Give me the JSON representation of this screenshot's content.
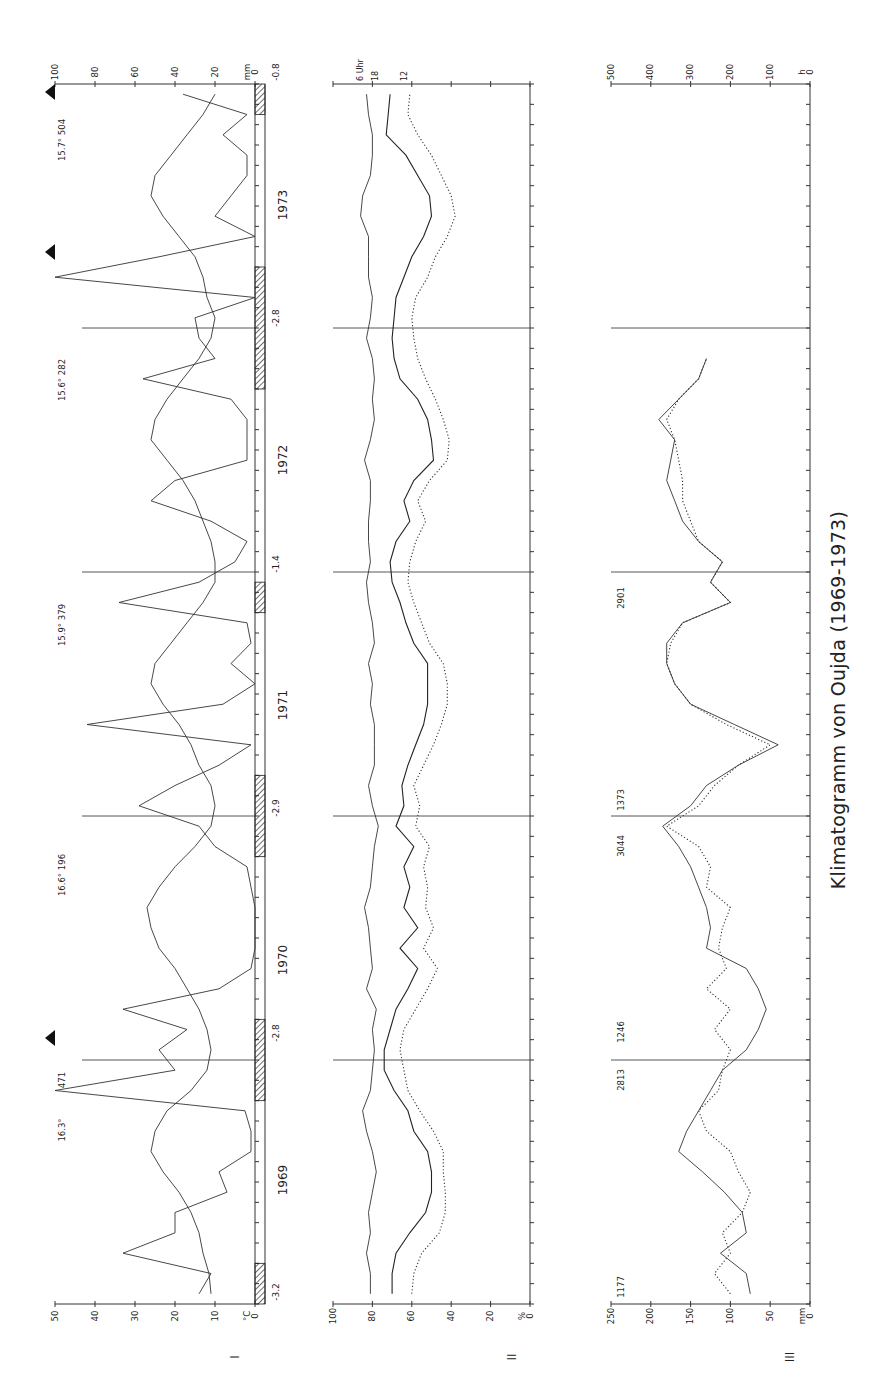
{
  "figure": {
    "title": "Klimatogramm von Oujda (1969-1973)",
    "orientation": "rotated 90° counter-clockwise; time axis runs bottom (Jan 1969) to top (Dec 1973)"
  },
  "panels": [
    {
      "id": "I",
      "label": "I"
    },
    {
      "id": "II",
      "label": "II"
    },
    {
      "id": "III",
      "label": "III"
    }
  ],
  "chart_data": [
    {
      "type": "line",
      "panel": "I",
      "title": "Temperatur und Niederschlag",
      "x_label": "Monat (1969-1973)",
      "years": [
        "1969",
        "1970",
        "1971",
        "1972",
        "1973"
      ],
      "months_per_year": 12,
      "y_left": {
        "unit": "°C",
        "ticks": [
          "0",
          "10",
          "20",
          "30",
          "40",
          "50"
        ],
        "range": [
          0,
          50
        ]
      },
      "y_right": {
        "unit": "mm",
        "ticks": [
          "0",
          "20",
          "40",
          "60",
          "80",
          "100"
        ],
        "range": [
          0,
          100
        ]
      },
      "series": [
        {
          "name": "Monatsmitteltemperatur (°C)",
          "style": "solid",
          "values": [
            11,
            11.5,
            13,
            14,
            16,
            19,
            23,
            26,
            25,
            22,
            16,
            12,
            11,
            12,
            14,
            17,
            20,
            24,
            26,
            27,
            24,
            20,
            15,
            11,
            10,
            11,
            14,
            16,
            19,
            23,
            26,
            25,
            21,
            17,
            13,
            10,
            10,
            11,
            13,
            15,
            18,
            22,
            26,
            25,
            22,
            18,
            14,
            11,
            10,
            12,
            13,
            15,
            19,
            23,
            26,
            25,
            21,
            17,
            13,
            10
          ]
        },
        {
          "name": "Niederschlag (mm)",
          "style": "solid-peaked",
          "values": [
            28,
            22,
            66,
            40,
            40,
            14,
            18,
            2,
            2,
            5,
            100,
            40,
            48,
            34,
            66,
            18,
            2,
            0,
            0,
            0,
            2,
            4,
            20,
            28,
            58,
            40,
            18,
            2,
            84,
            16,
            0,
            12,
            2,
            4,
            68,
            28,
            10,
            4,
            22,
            52,
            40,
            4,
            4,
            4,
            12,
            56,
            20,
            28,
            30,
            0,
            100,
            48,
            0,
            20,
            12,
            4,
            4,
            16,
            4,
            36
          ]
        }
      ],
      "cold_bars": {
        "description": "hatched bars = absolute minimum below 0 °C",
        "labels": [
          "-3.2",
          "-2.8",
          "-2.9",
          "-1.4",
          "-2.8",
          "-0.8"
        ]
      },
      "annotations": [
        {
          "text": "16.3°",
          "year": "1969"
        },
        {
          "text": "471",
          "year": "1969"
        },
        {
          "text": "16.6° 196",
          "year": "1970"
        },
        {
          "text": "15.9° 379",
          "year": "1971"
        },
        {
          "text": "15.6° 282",
          "year": "1972"
        },
        {
          "text": "15.7° 504",
          "year": "1973"
        }
      ],
      "overflow_markers": [
        "1969 Nov",
        "1973 Feb",
        "1973 Dec"
      ]
    },
    {
      "type": "line",
      "panel": "II",
      "title": "Relative Luftfeuchtigkeit",
      "y": {
        "unit": "%",
        "ticks": [
          "0",
          "20",
          "40",
          "60",
          "80",
          "100"
        ],
        "range": [
          0,
          100
        ]
      },
      "legend": [
        "6 Uhr",
        "18",
        "12"
      ],
      "series": [
        {
          "name": "6 Uhr",
          "style": "solid",
          "values": [
            81,
            81,
            83,
            81,
            82,
            80,
            78,
            80,
            83,
            85,
            81,
            80,
            79,
            80,
            78,
            83,
            80,
            81,
            82,
            84,
            81,
            80,
            79,
            77,
            80,
            82,
            79,
            79,
            79,
            81,
            80,
            82,
            79,
            80,
            82,
            83,
            81,
            82,
            82,
            81,
            81,
            84,
            81,
            79,
            80,
            79,
            80,
            83,
            81,
            80,
            82,
            82,
            82,
            86,
            85,
            81,
            80,
            80,
            82,
            83
          ]
        },
        {
          "name": "18 Uhr",
          "style": "solid",
          "values": [
            70,
            70,
            68,
            61,
            53,
            50,
            50,
            52,
            59,
            62,
            69,
            74,
            74,
            71,
            68,
            62,
            57,
            66,
            57,
            64,
            61,
            64,
            59,
            68,
            64,
            65,
            62,
            58,
            54,
            52,
            52,
            52,
            59,
            63,
            66,
            70,
            71,
            68,
            61,
            64,
            59,
            49,
            50,
            52,
            57,
            66,
            69,
            70,
            69,
            68,
            64,
            60,
            54,
            50,
            51,
            57,
            63,
            73,
            72,
            71
          ]
        },
        {
          "name": "12 Uhr",
          "style": "dotted",
          "values": [
            60,
            59,
            55,
            46,
            43,
            43,
            44,
            44,
            49,
            56,
            62,
            64,
            66,
            64,
            58,
            52,
            47,
            54,
            49,
            53,
            52,
            54,
            51,
            58,
            56,
            59,
            54,
            49,
            45,
            42,
            42,
            44,
            51,
            55,
            59,
            62,
            61,
            58,
            53,
            57,
            51,
            42,
            41,
            44,
            48,
            53,
            57,
            59,
            60,
            58,
            52,
            48,
            42,
            38,
            40,
            45,
            50,
            57,
            62,
            61
          ]
        }
      ]
    },
    {
      "type": "line",
      "panel": "III",
      "title": "Niederschlag und Sonnenscheindauer",
      "y_left": {
        "unit": "mm",
        "ticks": [
          "0",
          "50",
          "100",
          "150",
          "200",
          "250"
        ],
        "range": [
          0,
          250
        ]
      },
      "y_right": {
        "unit": "h",
        "ticks": [
          "0",
          "100",
          "200",
          "300",
          "400",
          "500"
        ],
        "range": [
          0,
          500
        ]
      },
      "series": [
        {
          "name": "Sonnenscheindauer (h)",
          "style": "solid",
          "values": [
            150,
            160,
            225,
            160,
            170,
            215,
            270,
            330,
            310,
            280,
            250,
            220,
            160,
            130,
            110,
            130,
            160,
            260,
            250,
            260,
            280,
            300,
            330,
            370,
            300,
            260,
            180,
            80,
            190,
            300,
            340,
            360,
            360,
            320,
            200,
            250,
            220,
            280,
            320,
            340,
            360,
            350,
            340,
            380,
            330,
            280,
            260,
            220,
            160,
            130,
            240,
            90,
            200,
            220,
            260,
            320,
            300,
            340,
            280,
            360
          ]
        },
        {
          "name": "Niederschlag (mm)",
          "style": "dotted",
          "values": [
            200,
            240,
            200,
            220,
            170,
            150,
            180,
            200,
            260,
            280,
            230,
            220,
            200,
            240,
            200,
            260,
            210,
            230,
            220,
            200,
            260,
            250,
            280,
            360,
            280,
            240,
            180,
            100,
            210,
            300,
            340,
            360,
            350,
            320,
            200,
            250,
            220,
            280,
            300,
            320,
            320,
            330,
            340,
            360,
            330,
            280,
            260,
            220,
            160,
            130,
            240,
            90,
            200,
            220,
            260,
            320,
            300,
            340,
            280,
            360
          ]
        }
      ],
      "annotations": [
        {
          "text": "1177",
          "year": "1969"
        },
        {
          "text": "2813",
          "year": "1970"
        },
        {
          "text": "1246",
          "year": "1970"
        },
        {
          "text": "3044",
          "year": "1971"
        },
        {
          "text": "1373",
          "year": "1971"
        },
        {
          "text": "2901",
          "year": "1972"
        }
      ]
    }
  ]
}
